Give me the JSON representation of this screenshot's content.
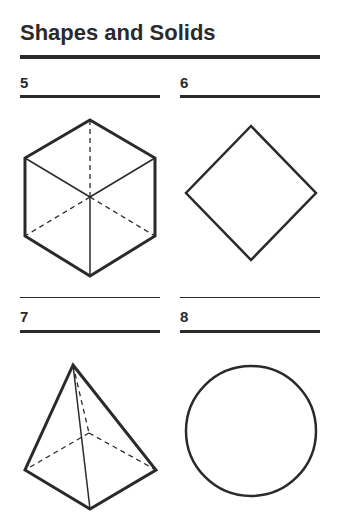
{
  "title": "Shapes and Solids",
  "items": [
    {
      "number": "5",
      "shape": "cube"
    },
    {
      "number": "6",
      "shape": "square"
    },
    {
      "number": "7",
      "shape": "square-pyramid"
    },
    {
      "number": "8",
      "shape": "circle"
    }
  ],
  "colors": {
    "ink": "#2a2a2a",
    "background": "#ffffff"
  }
}
